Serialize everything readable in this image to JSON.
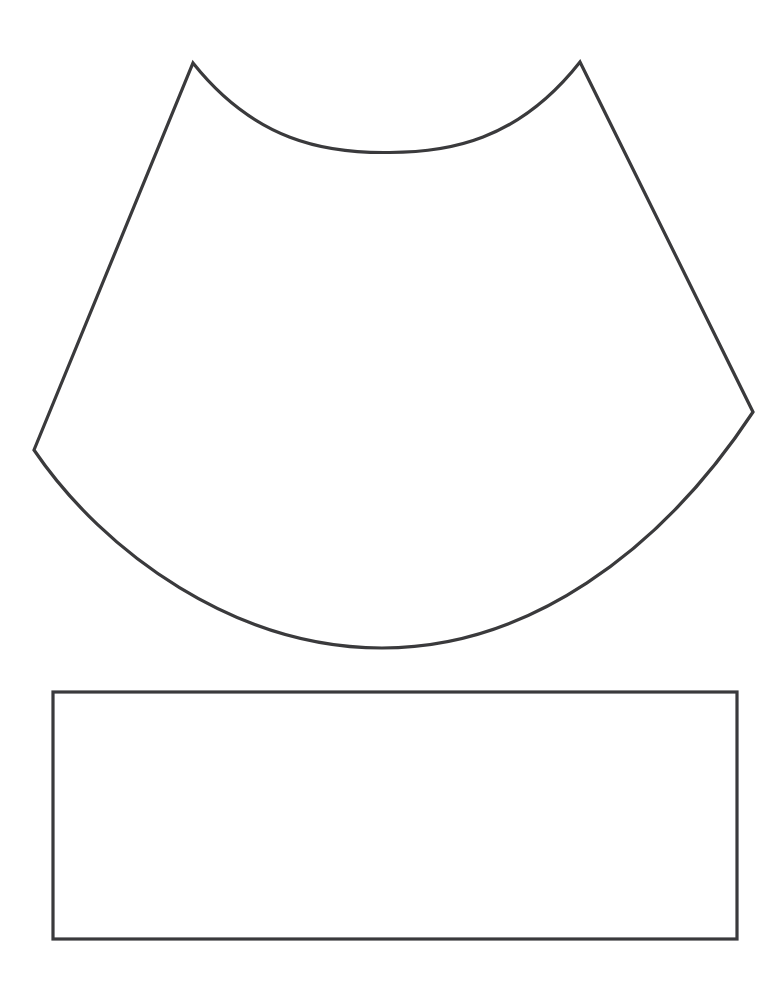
{
  "page": {
    "background_color": "#ffffff",
    "width": 765,
    "height": 991
  },
  "style": {
    "stroke_color": "#3a3a3c",
    "fill_color": "#ffffff",
    "stroke_width": 3.2
  },
  "shapes": [
    {
      "id": "cape-panel",
      "name": "curved-cape-panel",
      "description": "Annulus-sector pattern piece with two pointed top peaks, concave top arc, tapering straight sides and convex bottom arc",
      "path": "M 193 63 C 255 141 325 153 386.5 152.5 C 448 153 518 141 580 62 L 753 412 C 660 553 527 648 382 648 C 236 648 104 553 34 450 Z",
      "geometry": {
        "top_left_peak": [
          193,
          63
        ],
        "top_right_peak": [
          580,
          62
        ],
        "top_arc_lowest": [
          386,
          152
        ],
        "left_vertex": [
          34,
          450
        ],
        "right_vertex": [
          753,
          412
        ],
        "bottom_arc_lowest": [
          382,
          648
        ]
      }
    },
    {
      "id": "band-rectangle",
      "name": "rectangular-band-piece",
      "description": "Plain rectangle pattern piece below the curved panel",
      "x": 53,
      "y": 692,
      "width": 684,
      "height": 247
    }
  ]
}
